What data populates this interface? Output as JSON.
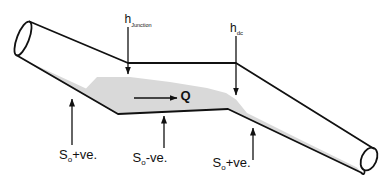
{
  "diagram": {
    "labels": {
      "h_junction": {
        "symbol": "h",
        "subscript": "Junction"
      },
      "h_dc": {
        "symbol": "h",
        "subscript": "dc"
      },
      "flow": {
        "symbol": "Q"
      },
      "slope_left": {
        "symbol": "S",
        "subscript": "o",
        "sign": "+ve."
      },
      "slope_middle": {
        "symbol": "S",
        "subscript": "o",
        "sign": "-ve."
      },
      "slope_right": {
        "symbol": "S",
        "subscript": "o",
        "sign": "+ve."
      }
    },
    "colors": {
      "line": "#111111",
      "text": "#111111",
      "water_fill": "#d9d9d9",
      "background": "#ffffff"
    }
  }
}
